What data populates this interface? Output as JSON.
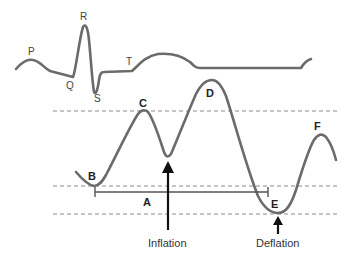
{
  "ecg": {
    "labels": {
      "p": "P",
      "q": "Q",
      "r": "R",
      "s": "S",
      "t": "T"
    }
  },
  "pressure": {
    "points": {
      "a": "A",
      "b": "B",
      "c": "C",
      "d": "D",
      "e": "E",
      "f": "F"
    }
  },
  "annotations": {
    "inflation": "Inflation",
    "deflation": "Deflation"
  },
  "colors": {
    "trace": "#6b6b6b",
    "dashed": "#8a8a8a",
    "arrow": "#111111"
  }
}
